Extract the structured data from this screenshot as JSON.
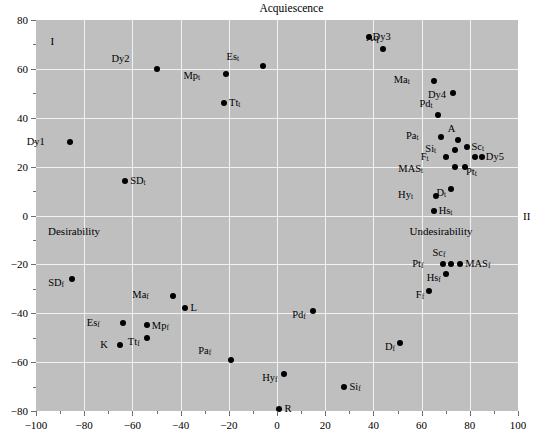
{
  "chart_data": {
    "type": "scatter",
    "title": "Acquiescence",
    "xlabel": "",
    "ylabel": "",
    "xlim": [
      -100,
      100
    ],
    "ylim": [
      -80,
      80
    ],
    "xticks": [
      -100,
      -80,
      -60,
      -40,
      -20,
      0,
      20,
      40,
      60,
      80,
      100
    ],
    "xticklabels": [
      "−100",
      "−80",
      "−60",
      "−40",
      "−20",
      "0",
      "20",
      "40",
      "60",
      "80",
      "100"
    ],
    "yticks": [
      -80,
      -60,
      -40,
      -20,
      0,
      20,
      40,
      60,
      80
    ],
    "yticklabels": [
      "−80",
      "−60",
      "−40",
      "−20",
      "0",
      "20",
      "40",
      "60",
      "80"
    ],
    "grid": true,
    "legend": "none",
    "annotations": [
      {
        "name": "axis-label-acquiescence",
        "text": "Acquiescence",
        "x": 6,
        "y": 88
      },
      {
        "name": "quadrant-label-I",
        "text": "I",
        "x": -94,
        "y": 72
      },
      {
        "name": "quadrant-label-II",
        "text": "II",
        "x": 106,
        "y": -2
      },
      {
        "name": "axis-label-desirability",
        "text": "Desirability",
        "x": -95,
        "y": -6
      },
      {
        "name": "axis-label-undesirability",
        "text": "Undesirability",
        "x": 55,
        "y": -6
      }
    ],
    "points": [
      {
        "label": "Dy3",
        "base": "Dy3",
        "sub": "",
        "x": 38,
        "y": 73,
        "lx": 4,
        "ly": 0
      },
      {
        "label": "Aq",
        "base": "Aq",
        "sub": "",
        "x": 44,
        "y": 68,
        "lx": -4,
        "ly": -11
      },
      {
        "label": "Dy2",
        "base": "Dy2",
        "sub": "",
        "x": -50,
        "y": 60,
        "lx": -27,
        "ly": -10
      },
      {
        "label": "Es_t",
        "base": "Es",
        "sub": "t",
        "x": -6,
        "y": 61,
        "lx": -23,
        "ly": -9
      },
      {
        "label": "Mp_t",
        "base": "Mp",
        "sub": "t",
        "x": -21,
        "y": 58,
        "lx": -26,
        "ly": 2
      },
      {
        "label": "Ma_t",
        "base": "Ma",
        "sub": "t",
        "x": 65,
        "y": 55,
        "lx": -24,
        "ly": -1
      },
      {
        "label": "Dy4",
        "base": "Dy4",
        "sub": "",
        "x": 73,
        "y": 50,
        "lx": -7,
        "ly": 2
      },
      {
        "label": "Tt_t",
        "base": "Tt",
        "sub": "t",
        "x": -22,
        "y": 46,
        "lx": 5,
        "ly": 0
      },
      {
        "label": "Pd_t",
        "base": "Pd",
        "sub": "t",
        "x": 67,
        "y": 41,
        "lx": -6,
        "ly": -11
      },
      {
        "label": "Pa_t",
        "base": "Pa",
        "sub": "t",
        "x": 68,
        "y": 32,
        "lx": -22,
        "ly": -1
      },
      {
        "label": "A",
        "base": "A",
        "sub": "",
        "x": 75,
        "y": 31,
        "lx": -2,
        "ly": -11
      },
      {
        "label": "Si_t",
        "base": "Si",
        "sub": "t",
        "x": 74,
        "y": 27,
        "lx": -19,
        "ly": -1
      },
      {
        "label": "Sc_t",
        "base": "Sc",
        "sub": "t",
        "x": 79,
        "y": 28,
        "lx": 4,
        "ly": 0
      },
      {
        "label": "Dy1",
        "base": "Dy1",
        "sub": "",
        "x": -86,
        "y": 30,
        "lx": -25,
        "ly": 0
      },
      {
        "label": "F_t",
        "base": "F",
        "sub": "t",
        "x": 70,
        "y": 24,
        "lx": -17,
        "ly": 0
      },
      {
        "label": "Dy5",
        "base": "Dy5",
        "sub": "",
        "x": 85,
        "y": 24,
        "lx": 4,
        "ly": 0
      },
      {
        "label": "Dy5b",
        "base": "",
        "sub": "",
        "x": 82,
        "y": 24,
        "lx": 0,
        "ly": 0
      },
      {
        "label": "MAS_t",
        "base": "MAS",
        "sub": "t",
        "x": 74,
        "y": 20,
        "lx": -32,
        "ly": 2
      },
      {
        "label": "Pt_t",
        "base": "Pt",
        "sub": "t",
        "x": 78,
        "y": 20,
        "lx": 1,
        "ly": 5
      },
      {
        "label": "SD_t",
        "base": "SD",
        "sub": "t",
        "x": -63,
        "y": 14,
        "lx": 5,
        "ly": 0
      },
      {
        "label": "D_t",
        "base": "D",
        "sub": "t",
        "x": 72,
        "y": 11,
        "lx": -4,
        "ly": 4
      },
      {
        "label": "Hy_t",
        "base": "Hy",
        "sub": "t",
        "x": 66,
        "y": 8,
        "lx": -23,
        "ly": -1
      },
      {
        "label": "Hs_t",
        "base": "Hs",
        "sub": "t",
        "x": 65,
        "y": 2,
        "lx": 5,
        "ly": 0
      },
      {
        "label": "Pt_f",
        "base": "Pt",
        "sub": "f",
        "x": 69,
        "y": -20,
        "lx": -20,
        "ly": 0
      },
      {
        "label": "Sc_f",
        "base": "Sc",
        "sub": "f",
        "x": 72,
        "y": -20,
        "lx": -5,
        "ly": -11
      },
      {
        "label": "MAS_f",
        "base": "MAS",
        "sub": "f",
        "x": 76,
        "y": -20,
        "lx": 5,
        "ly": 0
      },
      {
        "label": "Hs_f",
        "base": "Hs",
        "sub": "f",
        "x": 70,
        "y": -24,
        "lx": -5,
        "ly": 4
      },
      {
        "label": "SD_f",
        "base": "SD",
        "sub": "f",
        "x": -85,
        "y": -26,
        "lx": -8,
        "ly": 4
      },
      {
        "label": "Ma_f",
        "base": "Ma",
        "sub": "f",
        "x": -43,
        "y": -33,
        "lx": -24,
        "ly": -1
      },
      {
        "label": "F_f",
        "base": "F",
        "sub": "f",
        "x": 63,
        "y": -31,
        "lx": -5,
        "ly": 4
      },
      {
        "label": "L",
        "base": "L",
        "sub": "",
        "x": -38,
        "y": -38,
        "lx": 5,
        "ly": 0
      },
      {
        "label": "Pd_f",
        "base": "Pd",
        "sub": "f",
        "x": 15,
        "y": -39,
        "lx": -7,
        "ly": 4
      },
      {
        "label": "Es_f",
        "base": "Es",
        "sub": "f",
        "x": -64,
        "y": -44,
        "lx": -23,
        "ly": 0
      },
      {
        "label": "Mp_f",
        "base": "Mp",
        "sub": "f",
        "x": -54,
        "y": -45,
        "lx": 5,
        "ly": 1
      },
      {
        "label": "Tt_f",
        "base": "Tt",
        "sub": "f",
        "x": -54,
        "y": -50,
        "lx": -7,
        "ly": 4
      },
      {
        "label": "K",
        "base": "K",
        "sub": "",
        "x": -65,
        "y": -53,
        "lx": -12,
        "ly": 0
      },
      {
        "label": "D_f",
        "base": "D",
        "sub": "f",
        "x": 51,
        "y": -52,
        "lx": -5,
        "ly": 4
      },
      {
        "label": "Pa_f",
        "base": "Pa",
        "sub": "f",
        "x": -19,
        "y": -59,
        "lx": -20,
        "ly": -9
      },
      {
        "label": "Hy_f",
        "base": "Hy",
        "sub": "f",
        "x": 3,
        "y": -65,
        "lx": -7,
        "ly": 4
      },
      {
        "label": "Si_f",
        "base": "Si",
        "sub": "f",
        "x": 28,
        "y": -70,
        "lx": 5,
        "ly": 0
      },
      {
        "label": "R",
        "base": "R",
        "sub": "",
        "x": 1,
        "y": -79,
        "lx": 5,
        "ly": 0
      }
    ]
  }
}
